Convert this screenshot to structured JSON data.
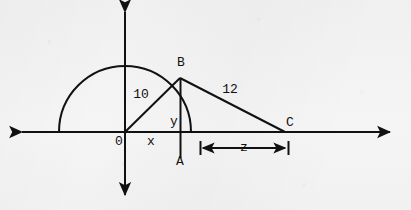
{
  "figure": {
    "kind": "geometry-diagram",
    "canvas": {
      "width": 411,
      "height": 210
    },
    "colors": {
      "ink": "#111111",
      "background": "#f3f3f3"
    },
    "axes": {
      "origin": {
        "x": 125,
        "y": 132
      },
      "x_axis": {
        "from_x": 22,
        "to_x": 390,
        "y": 132,
        "arrows": "both"
      },
      "y_axis": {
        "x": 125,
        "from_y": 12,
        "to_y": 195,
        "arrows": "both"
      }
    },
    "semicircle": {
      "center_x": 125,
      "center_y": 132,
      "radius": 66,
      "left_end_x": 59,
      "right_end_x": 191
    },
    "points": [
      {
        "id": "O",
        "label": "0",
        "x": 125,
        "y": 132,
        "label_x": 119,
        "label_y": 141
      },
      {
        "id": "B",
        "label": "B",
        "x": 180,
        "y": 78,
        "label_x": 181,
        "label_y": 62
      },
      {
        "id": "A",
        "label": "A",
        "x": 180,
        "y": 160,
        "label_x": 180,
        "label_y": 160
      },
      {
        "id": "C",
        "label": "C",
        "x": 285,
        "y": 132,
        "label_x": 289,
        "label_y": 122
      }
    ],
    "segments": [
      {
        "id": "OB",
        "from": "O",
        "to": "B",
        "length_label": "10",
        "label_x": 141,
        "label_y": 94
      },
      {
        "id": "BA",
        "from": "B",
        "to": "A",
        "length_label": "y",
        "label_x": 174,
        "label_y": 121
      },
      {
        "id": "BC",
        "from": "B",
        "to": "C",
        "length_label": "12",
        "label_x": 230,
        "label_y": 89
      },
      {
        "id": "OA",
        "from": "O",
        "to": "A",
        "length_label": "x",
        "label_x": 151,
        "label_y": 141
      }
    ],
    "dimension": {
      "id": "z",
      "label": "z",
      "label_x": 243,
      "label_y": 148,
      "y": 148,
      "from_x": 200,
      "to_x": 288
    },
    "labels": {
      "origin": "0",
      "x_segment": "x",
      "y_segment": "y",
      "radius": "10",
      "hypotenuse": "12",
      "dimension": "z",
      "point_a": "A",
      "point_b": "B",
      "point_c": "C"
    }
  }
}
